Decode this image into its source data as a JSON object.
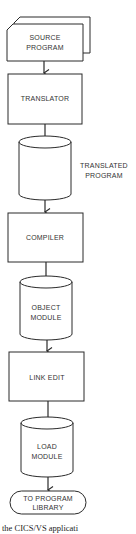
{
  "diagram": {
    "type": "flowchart",
    "nodes": [
      {
        "id": "source",
        "shape": "card-stack",
        "lines": [
          "SOURCE",
          "PROGRAM"
        ]
      },
      {
        "id": "translator",
        "shape": "process",
        "lines": [
          "TRANSLATOR"
        ]
      },
      {
        "id": "translated",
        "shape": "disk",
        "lines": [
          "TRANSLATED",
          "PROGRAM"
        ],
        "label_position": "right"
      },
      {
        "id": "compiler",
        "shape": "process",
        "lines": [
          "COMPILER"
        ]
      },
      {
        "id": "object",
        "shape": "disk",
        "lines": [
          "OBJECT",
          "MODULE"
        ]
      },
      {
        "id": "linkedit",
        "shape": "process",
        "lines": [
          "LINK EDIT"
        ]
      },
      {
        "id": "load",
        "shape": "disk",
        "lines": [
          "LOAD",
          "MODULE"
        ]
      },
      {
        "id": "library",
        "shape": "terminal",
        "lines": [
          "TO PROGRAM",
          "LIBRARY"
        ]
      }
    ],
    "edges": [
      [
        "source",
        "translator"
      ],
      [
        "translator",
        "translated"
      ],
      [
        "translated",
        "compiler"
      ],
      [
        "compiler",
        "object"
      ],
      [
        "object",
        "linkedit"
      ],
      [
        "linkedit",
        "load"
      ],
      [
        "load",
        "library"
      ]
    ],
    "caption": "the CICS/VS applicati"
  }
}
